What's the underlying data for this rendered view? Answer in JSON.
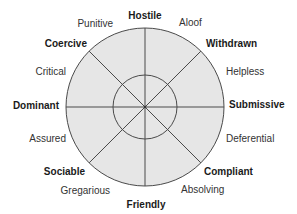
{
  "diagram": {
    "type": "interpersonal-circumplex",
    "colors": {
      "fill": "#e6e6e6",
      "stroke": "#4a4a4a",
      "text_primary": "#1a1a1a",
      "text_secondary": "#333333"
    },
    "primary_labels": {
      "hostile": "Hostile",
      "withdrawn": "Withdrawn",
      "submissive": "Submissive",
      "compliant": "Compliant",
      "friendly": "Friendly",
      "sociable": "Sociable",
      "dominant": "Dominant",
      "coercive": "Coercive"
    },
    "secondary_labels": {
      "aloof": "Aloof",
      "helpless": "Helpless",
      "deferential": "Deferential",
      "absolving": "Absolving",
      "gregarious": "Gregarious",
      "assured": "Assured",
      "critical": "Critical",
      "punitive": "Punitive"
    },
    "segments": 8
  }
}
